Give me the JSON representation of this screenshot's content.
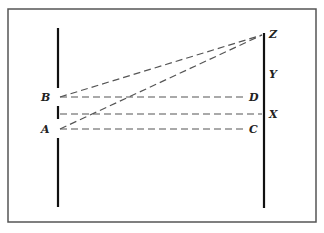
{
  "diagram": {
    "frame": {
      "x": 8,
      "y": 9,
      "width": 308,
      "height": 213,
      "stroke": "#555555"
    },
    "colors": {
      "solid_line": "#111111",
      "dashed_line": "#555555",
      "label": "#222222"
    },
    "left_line": {
      "x": 58,
      "segments": [
        [
          28,
          88
        ],
        [
          106,
          119
        ],
        [
          138,
          207
        ]
      ]
    },
    "right_line": {
      "x": 264,
      "y1": 33,
      "y2": 208
    },
    "labels": {
      "B": {
        "text": "B",
        "x": 41,
        "y": 101
      },
      "A": {
        "text": "A",
        "x": 41,
        "y": 133
      },
      "Z": {
        "text": "Z",
        "x": 269,
        "y": 38
      },
      "Y": {
        "text": "Y",
        "x": 269,
        "y": 78
      },
      "D": {
        "text": "D",
        "x": 249,
        "y": 101
      },
      "X": {
        "text": "X",
        "x": 269,
        "y": 118
      },
      "C": {
        "text": "C",
        "x": 249,
        "y": 133
      }
    },
    "dashed_lines": [
      {
        "name": "B-to-Z",
        "x1": 60,
        "y1": 97,
        "x2": 262,
        "y2": 35
      },
      {
        "name": "A-to-Z",
        "x1": 60,
        "y1": 129,
        "x2": 262,
        "y2": 35
      },
      {
        "name": "B-to-D",
        "x1": 60,
        "y1": 97,
        "x2": 246,
        "y2": 97
      },
      {
        "name": "gap-to-X",
        "x1": 60,
        "y1": 114,
        "x2": 262,
        "y2": 114
      },
      {
        "name": "A-to-C",
        "x1": 60,
        "y1": 129,
        "x2": 246,
        "y2": 129
      }
    ]
  }
}
